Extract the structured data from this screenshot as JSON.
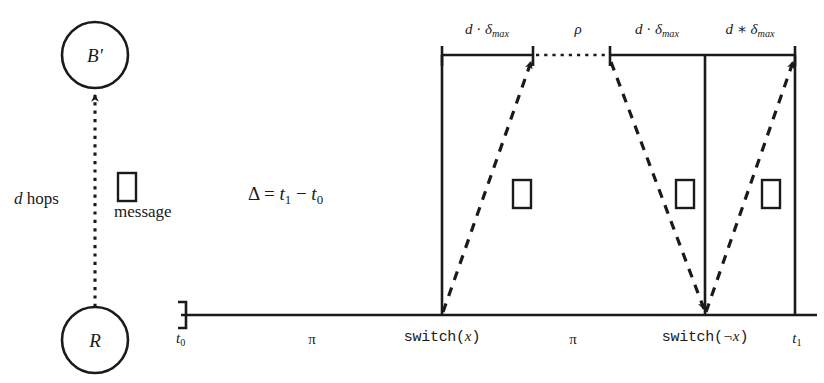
{
  "diagram": {
    "colors": {
      "ink": "#1a1a1a",
      "background": "#ffffff"
    },
    "nodes": [
      {
        "id": "b-prime",
        "label": "B",
        "prime": "′",
        "cx": 95,
        "cy": 55,
        "r": 33
      },
      {
        "id": "r",
        "label": "R",
        "prime": "",
        "cx": 95,
        "cy": 340,
        "r": 33
      }
    ],
    "hop_label": {
      "var": "d",
      "text": " hops"
    },
    "message_label": "message",
    "delta_label": {
      "lhs": "Δ",
      "eq": " = ",
      "t1": "t",
      "s1": "1",
      "minus": " − ",
      "t0": "t",
      "s0": "0"
    },
    "top_segments": [
      {
        "id": "seg-1",
        "var": "d",
        "op": " · ",
        "sym": "δ",
        "sub": "max",
        "x": 487
      },
      {
        "id": "seg-rho",
        "var": "",
        "op": "",
        "sym": "ρ",
        "sub": "",
        "x": 578
      },
      {
        "id": "seg-2",
        "var": "d",
        "op": " · ",
        "sym": "δ",
        "sub": "max",
        "x": 657
      },
      {
        "id": "seg-3",
        "var": "d",
        "op": " ∗ ",
        "sym": "δ",
        "sub": "max",
        "x": 750
      }
    ],
    "axis": {
      "start_tick": {
        "id": "t0",
        "label": "t",
        "sub": "0",
        "x": 181
      },
      "end_tick": {
        "id": "t1",
        "label": "t",
        "sub": "1",
        "x": 795
      },
      "pi_labels": [
        {
          "id": "pi-left",
          "label": "π",
          "x": 312
        },
        {
          "id": "pi-right",
          "label": "π",
          "x": 573
        }
      ],
      "events": [
        {
          "id": "switch-x",
          "label": "switch(",
          "varname": "x",
          "close": ")",
          "x": 442
        },
        {
          "id": "switch-not-x",
          "label": "switch(",
          "varname": "¬x",
          "close": ")",
          "x": 705
        }
      ]
    },
    "message_boxes": [
      {
        "id": "msg-vertical",
        "x": 118,
        "y": 173,
        "w": 18,
        "h": 28
      },
      {
        "id": "msg-t1",
        "x": 513,
        "y": 180,
        "w": 18,
        "h": 28
      },
      {
        "id": "msg-t2",
        "x": 676,
        "y": 180,
        "w": 18,
        "h": 28
      },
      {
        "id": "msg-t3",
        "x": 762,
        "y": 180,
        "w": 18,
        "h": 28
      }
    ]
  }
}
